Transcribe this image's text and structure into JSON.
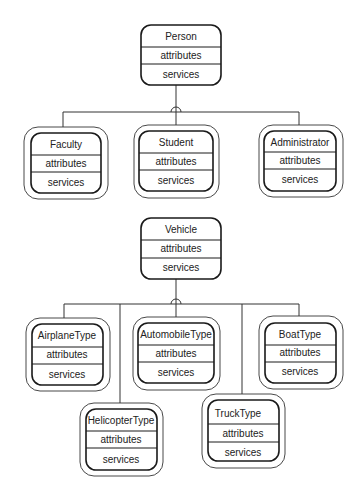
{
  "diagrams": [
    {
      "name": "person-hierarchy",
      "parent": {
        "name": "Person",
        "attributes_label": "attributes",
        "services_label": "services"
      },
      "children": [
        {
          "name": "Faculty",
          "attributes_label": "attributes",
          "services_label": "services"
        },
        {
          "name": "Student",
          "attributes_label": "attributes",
          "services_label": "services"
        },
        {
          "name": "Administrator",
          "attributes_label": "attributes",
          "services_label": "services"
        }
      ]
    },
    {
      "name": "vehicle-hierarchy",
      "parent": {
        "name": "Vehicle",
        "attributes_label": "attributes",
        "services_label": "services"
      },
      "children": [
        {
          "name": "AirplaneType",
          "attributes_label": "attributes",
          "services_label": "services"
        },
        {
          "name": "AutomobileType",
          "attributes_label": "attributes",
          "services_label": "services"
        },
        {
          "name": "BoatType",
          "attributes_label": "attributes",
          "services_label": "services"
        },
        {
          "name": "HelicopterType",
          "attributes_label": "attributes",
          "services_label": "services"
        },
        {
          "name": "TruckType",
          "attributes_label": "attributes",
          "services_label": "services"
        }
      ]
    }
  ],
  "colors": {
    "line": "#333333",
    "box_stroke": "#1a1a1a",
    "text": "#222222",
    "background": "#ffffff"
  }
}
